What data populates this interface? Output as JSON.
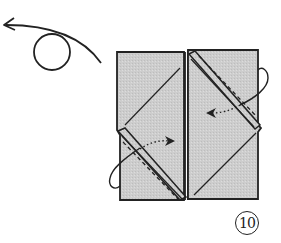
{
  "diagram": {
    "type": "origami-instruction-step",
    "step_number": "10",
    "symbols": [
      {
        "name": "turn-over",
        "description": "circle with curved arrow indicating turn the model over"
      },
      {
        "name": "fold-arrows",
        "description": "dotted arrows showing flaps folded inward"
      },
      {
        "name": "valley-fold-lines",
        "description": "dashed lines along diagonal flaps"
      }
    ],
    "colors": {
      "paper": "#cfcfcf",
      "line": "#222222",
      "background": "#ffffff"
    }
  }
}
